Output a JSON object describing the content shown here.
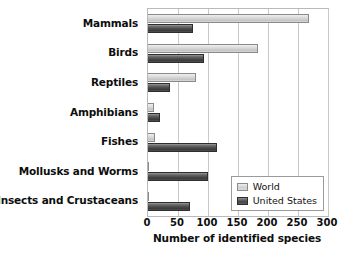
{
  "chart_data": {
    "type": "bar",
    "orientation": "horizontal",
    "title": "",
    "xlabel": "Number of identified species",
    "ylabel": "",
    "xlim": [
      0,
      300
    ],
    "xticks": [
      0,
      50,
      100,
      150,
      200,
      250,
      300
    ],
    "grid": true,
    "legend_position": "bottom-right-inside",
    "categories": [
      "Mammals",
      "Birds",
      "Reptiles",
      "Amphibians",
      "Fishes",
      "Mollusks and Worms",
      "Insects and Crustaceans"
    ],
    "series": [
      {
        "name": "World",
        "color": "#d2d2d2",
        "values": [
          268,
          183,
          80,
          10,
          12,
          2,
          2
        ]
      },
      {
        "name": "United States",
        "color": "#4a4a4a",
        "values": [
          75,
          93,
          37,
          20,
          115,
          100,
          70
        ]
      }
    ]
  },
  "legend": {
    "entries": [
      {
        "label": "World",
        "swatch": "world"
      },
      {
        "label": "United States",
        "swatch": "us"
      }
    ]
  },
  "axis": {
    "x_title": "Number of identified species",
    "x_tick_labels": [
      "0",
      "50",
      "100",
      "150",
      "200",
      "250",
      "300"
    ]
  }
}
